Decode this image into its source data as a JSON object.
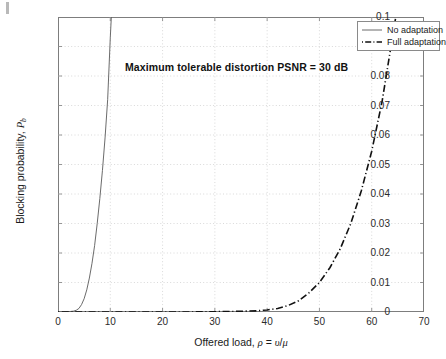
{
  "figure": {
    "background_color": "#ffffff",
    "axis_color": "#7d7d7d",
    "grid_color": "#c8c8c8",
    "text_color": "#1a1a1a"
  },
  "annotation": {
    "text": "Maximum tolerable distortion PSNR = 30 dB"
  },
  "legend": {
    "entries": [
      {
        "label": "No adaptation",
        "style": "solid",
        "color": "#5a5a5a"
      },
      {
        "label": "Full adaptation",
        "style": "dash-dot",
        "color": "#111111"
      }
    ]
  },
  "axes": {
    "x_title_prefix": "Offered load, ",
    "x_title_rho": "ρ",
    "x_title_eq": " = ",
    "x_title_nu": "υ",
    "x_title_slash": "/",
    "x_title_mu": "μ",
    "y_title_prefix": "Blocking probability, ",
    "y_title_P": "P",
    "y_title_sub": "b",
    "x_ticks": [
      "0",
      "10",
      "20",
      "30",
      "40",
      "50",
      "60",
      "70"
    ],
    "y_ticks": [
      "0",
      "0.01",
      "0.02",
      "0.03",
      "0.04",
      "0.05",
      "0.06",
      "0.07",
      "0.08",
      "0.09",
      "0.1"
    ]
  },
  "chart_data": {
    "type": "line",
    "title": "",
    "annotation": "Maximum tolerable distortion PSNR = 30 dB",
    "xlabel": "Offered load, ρ = υ/μ",
    "ylabel": "Blocking probability, P_b",
    "xlim": [
      0,
      70
    ],
    "ylim": [
      0,
      0.1
    ],
    "xticks": [
      0,
      10,
      20,
      30,
      40,
      50,
      60,
      70
    ],
    "yticks": [
      0,
      0.01,
      0.02,
      0.03,
      0.04,
      0.05,
      0.06,
      0.07,
      0.08,
      0.09,
      0.1
    ],
    "grid": true,
    "grid_style": "dotted",
    "legend_position": "upper right",
    "series": [
      {
        "name": "No adaptation",
        "style": "solid",
        "color": "#5a5a5a",
        "x": [
          0,
          1,
          2,
          3,
          3.5,
          4,
          4.5,
          5,
          5.5,
          6,
          6.5,
          7,
          7.5,
          8,
          8.5,
          9,
          9.5,
          10,
          10.2
        ],
        "y": [
          0,
          0,
          0.0001,
          0.0003,
          0.0006,
          0.0012,
          0.0025,
          0.0045,
          0.0075,
          0.0115,
          0.0165,
          0.0225,
          0.03,
          0.0385,
          0.048,
          0.059,
          0.072,
          0.093,
          0.1
        ]
      },
      {
        "name": "Full adaptation",
        "style": "dash-dot",
        "color": "#111111",
        "x": [
          0,
          5,
          10,
          15,
          20,
          25,
          30,
          34,
          38,
          40,
          42,
          44,
          46,
          48,
          50,
          52,
          54,
          56,
          58,
          60,
          62,
          64,
          64.6
        ],
        "y": [
          0,
          0,
          0,
          0,
          0,
          0,
          0.0001,
          0.0002,
          0.0004,
          0.0007,
          0.0012,
          0.0022,
          0.0038,
          0.0065,
          0.01,
          0.015,
          0.0215,
          0.03,
          0.041,
          0.0545,
          0.0715,
          0.0935,
          0.1
        ]
      }
    ]
  }
}
